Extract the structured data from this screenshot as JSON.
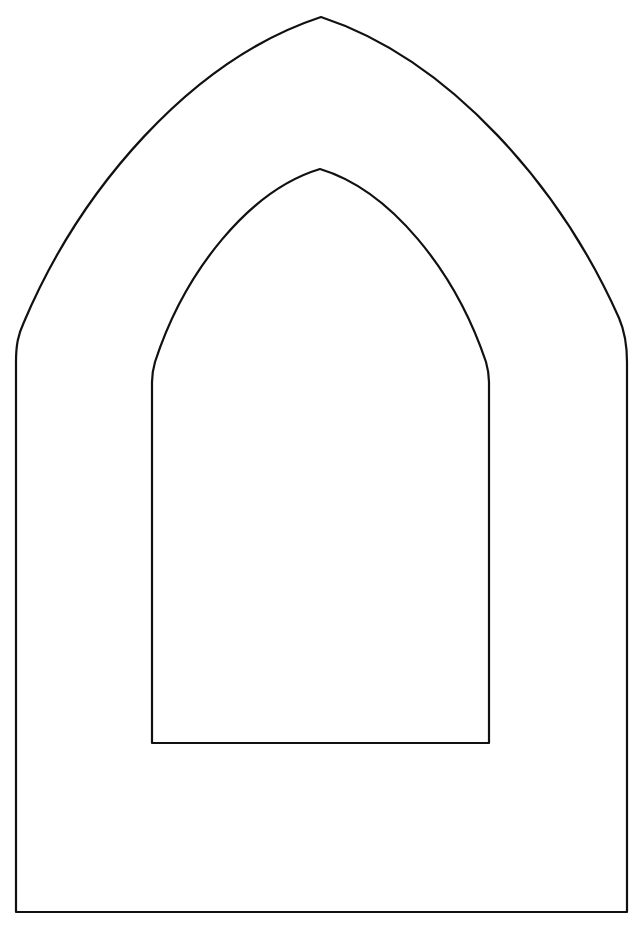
{
  "figure": {
    "title": "Gothic arch window frame outline",
    "background": "#ffffff",
    "stroke_color": "#111111",
    "stroke_width": 2.2,
    "outer_arch": {
      "apex": [
        321,
        17
      ],
      "left_x": 16,
      "right_x": 627,
      "spring_y": 360,
      "bottom_y": 912
    },
    "inner_opening": {
      "apex": [
        320,
        169
      ],
      "left_x": 152,
      "right_x": 489,
      "spring_y": 380,
      "bottom_y": 743
    }
  }
}
